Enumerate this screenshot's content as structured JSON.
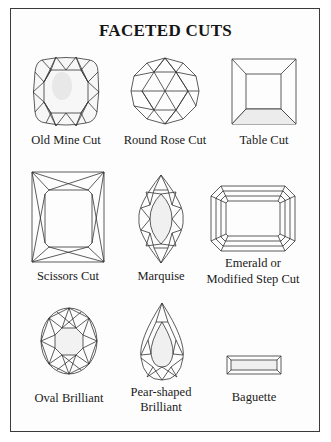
{
  "title": "FACETED CUTS",
  "cuts": [
    {
      "label": "Old Mine Cut"
    },
    {
      "label": "Round Rose Cut"
    },
    {
      "label": "Table Cut"
    },
    {
      "label": "Scissors Cut"
    },
    {
      "label": "Marquise"
    },
    {
      "label_line1": "Emerald or",
      "label_line2": "Modified Step Cut"
    },
    {
      "label": "Oval Brilliant"
    },
    {
      "label_line1": "Pear-shaped",
      "label_line2": "Brilliant"
    },
    {
      "label": "Baguette"
    }
  ],
  "colors": {
    "line": "#333333",
    "shade": "#e6e6e6",
    "border": "#3a3a3a"
  }
}
